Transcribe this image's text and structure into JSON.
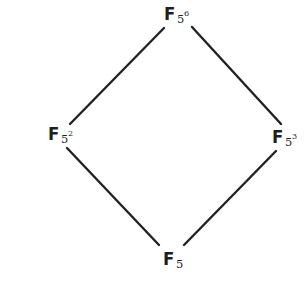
{
  "diagram": {
    "type": "hasse-diagram",
    "line_color": "#222222",
    "text_color": "#1e1e1e",
    "background": "#ffffff",
    "nodes": [
      {
        "id": "top",
        "base": "F",
        "sub": "5",
        "sup": "6",
        "label": "F_{5^6}",
        "x": 164,
        "y": 5
      },
      {
        "id": "left",
        "base": "F",
        "sub": "5",
        "sup": "2",
        "label": "F_{5^2}",
        "x": 48,
        "y": 125
      },
      {
        "id": "right",
        "base": "F",
        "sub": "5",
        "sup": "3",
        "label": "F_{5^3}",
        "x": 272,
        "y": 128
      },
      {
        "id": "bottom",
        "base": "F",
        "sub": "5",
        "sup": "",
        "label": "F_5",
        "x": 163,
        "y": 250
      }
    ],
    "edges": [
      {
        "from": "left",
        "to": "top",
        "x1": 70,
        "y1": 124,
        "x2": 164,
        "y2": 28
      },
      {
        "from": "right",
        "to": "top",
        "x1": 281,
        "y1": 124,
        "x2": 192,
        "y2": 27
      },
      {
        "from": "bottom",
        "to": "left",
        "x1": 159,
        "y1": 245,
        "x2": 67,
        "y2": 148
      },
      {
        "from": "bottom",
        "to": "right",
        "x1": 184,
        "y1": 245,
        "x2": 276,
        "y2": 151
      }
    ]
  }
}
